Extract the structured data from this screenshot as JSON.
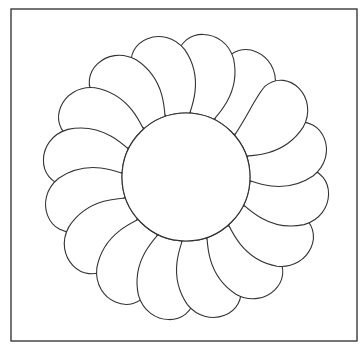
{
  "document": {
    "title": "Feathered Wreath Quilting Pattern",
    "kind": "line-art-diagram",
    "background_color": "#ffffff"
  },
  "canvas": {
    "width": 364,
    "height": 355
  },
  "frame": {
    "name": "outer-border",
    "x": 11,
    "y": 9,
    "width": 346,
    "height": 332,
    "stroke_color": "#3a3a3a",
    "stroke_width": 1.4,
    "fill": "none"
  },
  "wreath": {
    "name": "feathered-wreath",
    "center_x": 186,
    "center_y": 177,
    "petal_count": 16,
    "inner_radius": 64,
    "outer_radius": 160,
    "spiral_direction": "counterclockwise",
    "stroke_color": "#333333",
    "stroke_width": 1.1,
    "fill_color": "#ffffff",
    "petals": [
      {
        "index": 0,
        "angle_deg": 0
      },
      {
        "index": 1,
        "angle_deg": 22.5
      },
      {
        "index": 2,
        "angle_deg": 45
      },
      {
        "index": 3,
        "angle_deg": 67.5
      },
      {
        "index": 4,
        "angle_deg": 90
      },
      {
        "index": 5,
        "angle_deg": 112.5
      },
      {
        "index": 6,
        "angle_deg": 135
      },
      {
        "index": 7,
        "angle_deg": 157.5
      },
      {
        "index": 8,
        "angle_deg": 180
      },
      {
        "index": 9,
        "angle_deg": 202.5
      },
      {
        "index": 10,
        "angle_deg": 225
      },
      {
        "index": 11,
        "angle_deg": 247.5
      },
      {
        "index": 12,
        "angle_deg": 270
      },
      {
        "index": 13,
        "angle_deg": 292.5
      },
      {
        "index": 14,
        "angle_deg": 315
      },
      {
        "index": 15,
        "angle_deg": 337.5
      }
    ]
  },
  "center_medallion": {
    "name": "crosshatch-circle",
    "center_x": 186,
    "center_y": 177,
    "radius": 64,
    "stroke_color": "#333333",
    "stroke_width": 1.1,
    "fill_color": "#ffffff",
    "hatch": {
      "type": "diagonal-crosshatch",
      "angle_deg": 45,
      "spacing": 23,
      "line_count_per_direction": 7,
      "stroke_color": "#333333",
      "stroke_width": 1.2
    }
  },
  "palette": {
    "ink": "#333333",
    "frame_ink": "#3a3a3a",
    "paper": "#ffffff"
  }
}
